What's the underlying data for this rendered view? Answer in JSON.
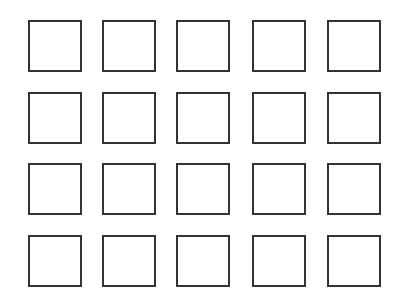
{
  "grid": {
    "rows": 4,
    "cols": 5,
    "stroke_color": "#333333",
    "background": "#ffffff",
    "col_x": [
      28,
      102,
      176,
      252,
      327
    ],
    "row_y": [
      20,
      92,
      163,
      235
    ],
    "cell_width": 54,
    "cell_height": 52,
    "cells": [
      {
        "row": 1,
        "col": 1,
        "filled": false
      },
      {
        "row": 1,
        "col": 2,
        "filled": false
      },
      {
        "row": 1,
        "col": 3,
        "filled": false
      },
      {
        "row": 1,
        "col": 4,
        "filled": false
      },
      {
        "row": 1,
        "col": 5,
        "filled": false
      },
      {
        "row": 2,
        "col": 1,
        "filled": false
      },
      {
        "row": 2,
        "col": 2,
        "filled": false
      },
      {
        "row": 2,
        "col": 3,
        "filled": false
      },
      {
        "row": 2,
        "col": 4,
        "filled": false
      },
      {
        "row": 2,
        "col": 5,
        "filled": false
      },
      {
        "row": 3,
        "col": 1,
        "filled": false
      },
      {
        "row": 3,
        "col": 2,
        "filled": false
      },
      {
        "row": 3,
        "col": 3,
        "filled": false
      },
      {
        "row": 3,
        "col": 4,
        "filled": false
      },
      {
        "row": 3,
        "col": 5,
        "filled": false
      },
      {
        "row": 4,
        "col": 1,
        "filled": false
      },
      {
        "row": 4,
        "col": 2,
        "filled": false
      },
      {
        "row": 4,
        "col": 3,
        "filled": false
      },
      {
        "row": 4,
        "col": 4,
        "filled": false
      },
      {
        "row": 4,
        "col": 5,
        "filled": false
      }
    ]
  }
}
